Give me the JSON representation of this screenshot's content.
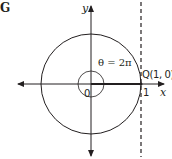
{
  "figure": {
    "label": "G",
    "y_axis_label": "y",
    "x_axis_label": "x",
    "origin_label": "0",
    "tick_label": "1",
    "angle_label": "θ = 2π",
    "point_label": "Q(1, 0)"
  },
  "colors": {
    "stroke": "#231f20",
    "background": "#ffffff"
  }
}
